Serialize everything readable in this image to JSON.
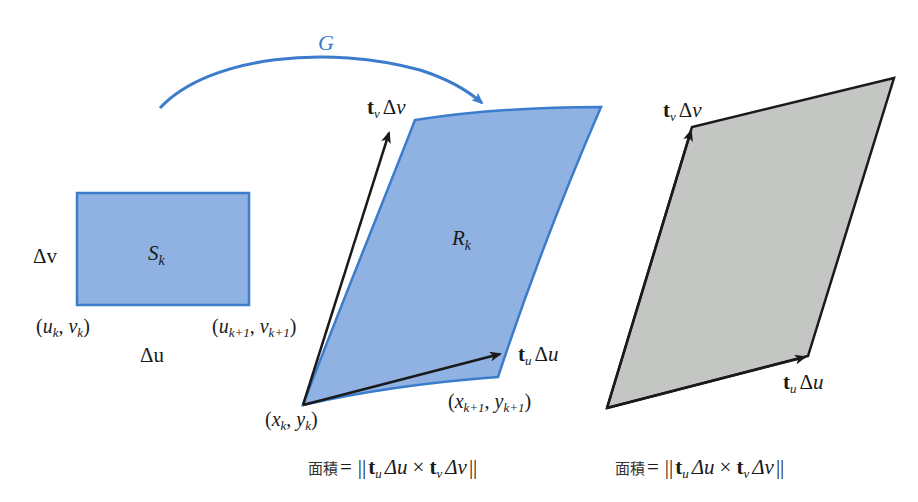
{
  "figure": {
    "mapping_label": "G",
    "colors": {
      "blue_fill": "#8fb2e2",
      "blue_stroke": "#3b7ccc",
      "gray_fill": "#c4c6c4",
      "vector_stroke": "#1a1a1a",
      "text": "#1a1a1a"
    }
  },
  "domain_rect": {
    "name": "S",
    "sub": "k",
    "side_label_v": "Δv",
    "side_label_u": "Δu",
    "corner_bl": {
      "open": "(",
      "a": "u",
      "a_sub": "k",
      "sep": ", ",
      "b": "v",
      "b_sub": "k",
      "close": ")"
    },
    "corner_br": {
      "open": "(",
      "a": "u",
      "a_sub": "k+1",
      "sep": ", ",
      "b": "v",
      "b_sub": "k+1",
      "close": ")"
    }
  },
  "image_region": {
    "name": "R",
    "sub": "k",
    "vector_v": {
      "t": "t",
      "t_sub": "v",
      "delta": "Δ",
      "var": "v"
    },
    "vector_u": {
      "t": "t",
      "t_sub": "u",
      "delta": "Δ",
      "var": "u"
    },
    "corner_bl": {
      "open": "(",
      "a": "x",
      "a_sub": "k",
      "sep": ", ",
      "b": "y",
      "b_sub": "k",
      "close": ")"
    },
    "corner_br": {
      "open": "(",
      "a": "x",
      "a_sub": "k+1",
      "sep": ", ",
      "b": "y",
      "b_sub": "k+1",
      "close": ")"
    },
    "formula": {
      "prefix": "面積",
      "eq": "=",
      "norm": "||",
      "t1": "t",
      "t1_sub": "u",
      "d1": "Δu",
      "times": "×",
      "t2": "t",
      "t2_sub": "v",
      "d2": "Δv"
    }
  },
  "parallelogram": {
    "vector_v": {
      "t": "t",
      "t_sub": "v",
      "delta": "Δ",
      "var": "v"
    },
    "vector_u": {
      "t": "t",
      "t_sub": "u",
      "delta": "Δ",
      "var": "u"
    },
    "formula": {
      "prefix": "面積",
      "eq": "=",
      "norm": "||",
      "t1": "t",
      "t1_sub": "u",
      "d1": "Δu",
      "times": "×",
      "t2": "t",
      "t2_sub": "v",
      "d2": "Δv"
    }
  }
}
